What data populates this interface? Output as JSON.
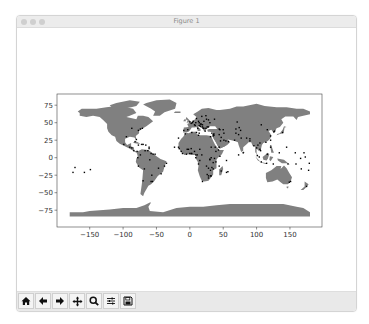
{
  "window": {
    "title": "Figure 1"
  },
  "toolbar": {
    "buttons": [
      {
        "name": "home",
        "icon": "home-icon",
        "glyph": "⌂"
      },
      {
        "name": "back",
        "icon": "arrow-left-icon",
        "glyph": "←"
      },
      {
        "name": "forward",
        "icon": "arrow-right-icon",
        "glyph": "→"
      },
      {
        "name": "pan",
        "icon": "move-icon",
        "glyph": "✥"
      },
      {
        "name": "zoom",
        "icon": "zoom-icon",
        "glyph": "🔍"
      },
      {
        "name": "configure-subplots",
        "icon": "sliders-icon",
        "glyph": "☰"
      },
      {
        "name": "save",
        "icon": "save-icon",
        "glyph": "💾"
      }
    ]
  },
  "colors": {
    "land": "#808080",
    "points": "#000000",
    "axes": "#444444",
    "tick_text": "#333333"
  },
  "chart_data": {
    "type": "scatter",
    "title": "",
    "xlabel": "",
    "ylabel": "",
    "xlim": [
      -199,
      198
    ],
    "ylim": [
      -99,
      91
    ],
    "xticks": [
      -150,
      -100,
      -50,
      0,
      50,
      100,
      150
    ],
    "yticks": [
      75,
      50,
      25,
      0,
      -25,
      -50,
      -75
    ],
    "xtick_labels": [
      "−150",
      "−100",
      "−50",
      "0",
      "50",
      "100",
      "150"
    ],
    "ytick_labels": [
      "75",
      "50",
      "25",
      "0",
      "−25",
      "−50",
      "−75"
    ],
    "grid": false,
    "legend": null,
    "background_layer": "world country polygons (gray fill)",
    "series": [
      {
        "name": "points",
        "marker_size": 1.4,
        "points": [
          [
            -77,
            39
          ],
          [
            -74,
            41
          ],
          [
            -71,
            42
          ],
          [
            -80,
            26
          ],
          [
            -87,
            42
          ],
          [
            -95,
            30
          ],
          [
            -90,
            15
          ],
          [
            -87,
            14
          ],
          [
            -84,
            10
          ],
          [
            -79,
            9
          ],
          [
            -99,
            19
          ],
          [
            -82,
            23
          ],
          [
            -77,
            18
          ],
          [
            -72,
            19
          ],
          [
            -70,
            19
          ],
          [
            -66,
            18
          ],
          [
            -61,
            13
          ],
          [
            -61,
            15
          ],
          [
            -63,
            10
          ],
          [
            -67,
            10
          ],
          [
            -74,
            4
          ],
          [
            -78,
            0
          ],
          [
            -77,
            -12
          ],
          [
            -68,
            -16
          ],
          [
            -57,
            -25
          ],
          [
            -56,
            -34
          ],
          [
            -58,
            -34
          ],
          [
            -70,
            -33
          ],
          [
            -47,
            -15
          ],
          [
            -43,
            -23
          ],
          [
            -38,
            -12
          ],
          [
            -35,
            -8
          ],
          [
            -60,
            -3
          ],
          [
            -55,
            5
          ],
          [
            -58,
            6
          ],
          [
            -52,
            5
          ],
          [
            -23,
            15
          ],
          [
            -17,
            15
          ],
          [
            -16,
            13
          ],
          [
            -13,
            9
          ],
          [
            -11,
            6
          ],
          [
            -5,
            5
          ],
          [
            -4,
            12
          ],
          [
            -2,
            12
          ],
          [
            0,
            6
          ],
          [
            2,
            6
          ],
          [
            3,
            6
          ],
          [
            7,
            9
          ],
          [
            2,
            13
          ],
          [
            9,
            4
          ],
          [
            11,
            4
          ],
          [
            15,
            12
          ],
          [
            18,
            4
          ],
          [
            9,
            0
          ],
          [
            15,
            -4
          ],
          [
            13,
            -9
          ],
          [
            19,
            -34
          ],
          [
            28,
            -26
          ],
          [
            31,
            -26
          ],
          [
            28,
            -29
          ],
          [
            26,
            -24
          ],
          [
            32,
            -26
          ],
          [
            35,
            -16
          ],
          [
            28,
            -15
          ],
          [
            31,
            -18
          ],
          [
            33,
            -14
          ],
          [
            39,
            -6
          ],
          [
            37,
            -1
          ],
          [
            32,
            0
          ],
          [
            30,
            -2
          ],
          [
            30,
            -3
          ],
          [
            25,
            -12
          ],
          [
            35,
            -7
          ],
          [
            45,
            2
          ],
          [
            43,
            11
          ],
          [
            39,
            9
          ],
          [
            38,
            15
          ],
          [
            32,
            15
          ],
          [
            31,
            30
          ],
          [
            13,
            32
          ],
          [
            10,
            36
          ],
          [
            3,
            36
          ],
          [
            -7,
            34
          ],
          [
            -17,
            28
          ],
          [
            47,
            -19
          ],
          [
            55,
            -21
          ],
          [
            57,
            -20
          ],
          [
            44,
            -12
          ],
          [
            55,
            -4
          ],
          [
            0,
            51
          ],
          [
            2,
            49
          ],
          [
            4,
            50
          ],
          [
            5,
            52
          ],
          [
            9,
            50
          ],
          [
            13,
            52
          ],
          [
            10,
            56
          ],
          [
            18,
            59
          ],
          [
            24,
            60
          ],
          [
            25,
            55
          ],
          [
            21,
            52
          ],
          [
            17,
            48
          ],
          [
            16,
            48
          ],
          [
            19,
            47
          ],
          [
            14,
            50
          ],
          [
            14,
            46
          ],
          [
            12,
            42
          ],
          [
            8,
            46
          ],
          [
            7,
            47
          ],
          [
            -3,
            40
          ],
          [
            -9,
            39
          ],
          [
            23,
            38
          ],
          [
            28,
            44
          ],
          [
            26,
            44
          ],
          [
            21,
            42
          ],
          [
            20,
            42
          ],
          [
            19,
            44
          ],
          [
            16,
            45
          ],
          [
            24,
            42
          ],
          [
            33,
            35
          ],
          [
            35,
            33
          ],
          [
            36,
            32
          ],
          [
            35,
            31
          ],
          [
            36,
            34
          ],
          [
            44,
            33
          ],
          [
            44,
            41
          ],
          [
            50,
            40
          ],
          [
            45,
            40
          ],
          [
            51,
            35
          ],
          [
            51,
            25
          ],
          [
            54,
            24
          ],
          [
            58,
            23
          ],
          [
            47,
            29
          ],
          [
            46,
            24
          ],
          [
            44,
            15
          ],
          [
            37,
            55
          ],
          [
            30,
            50
          ],
          [
            28,
            54
          ],
          [
            14,
            35
          ],
          [
            69,
            35
          ],
          [
            69,
            41
          ],
          [
            71,
            51
          ],
          [
            74,
            43
          ],
          [
            76,
            39
          ],
          [
            67,
            25
          ],
          [
            73,
            33
          ],
          [
            77,
            28
          ],
          [
            80,
            7
          ],
          [
            73,
            4
          ],
          [
            90,
            24
          ],
          [
            85,
            28
          ],
          [
            90,
            27
          ],
          [
            96,
            17
          ],
          [
            100,
            14
          ],
          [
            102,
            18
          ],
          [
            105,
            21
          ],
          [
            105,
            12
          ],
          [
            106,
            10
          ],
          [
            101,
            3
          ],
          [
            104,
            1
          ],
          [
            107,
            -6
          ],
          [
            115,
            -8
          ],
          [
            116,
            5
          ],
          [
            121,
            15
          ],
          [
            125,
            -9
          ],
          [
            107,
            47
          ],
          [
            116,
            40
          ],
          [
            121,
            31
          ],
          [
            114,
            22
          ],
          [
            121,
            25
          ],
          [
            127,
            38
          ],
          [
            126,
            37
          ],
          [
            139,
            36
          ],
          [
            147,
            -9
          ],
          [
            151,
            -34
          ],
          [
            149,
            -35
          ],
          [
            175,
            -41
          ],
          [
            159,
            -9
          ],
          [
            167,
            -16
          ],
          [
            178,
            -18
          ],
          [
            173,
            1
          ],
          [
            171,
            7
          ],
          [
            158,
            7
          ],
          [
            134,
            7
          ],
          [
            145,
            15
          ],
          [
            -175,
            -21
          ],
          [
            -172,
            -14
          ],
          [
            -158,
            -21
          ],
          [
            -149,
            -17
          ],
          [
            179,
            -8
          ],
          [
            166,
            -1
          ]
        ]
      }
    ]
  }
}
